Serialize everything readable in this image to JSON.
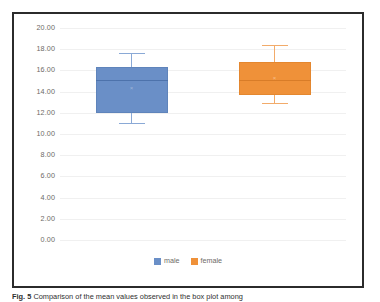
{
  "figure": {
    "caption_label": "Fig. 5",
    "caption_text": "Comparison of the mean values observed in the box plot among"
  },
  "chart_data": {
    "type": "box",
    "title": "",
    "xlabel": "",
    "ylabel": "",
    "ylim": [
      0.0,
      20.0
    ],
    "ytick_step": 2.0,
    "ytick_labels": [
      "20.00",
      "18.00",
      "16.00",
      "14.00",
      "12.00",
      "10.00",
      "8.00",
      "6.00",
      "4.00",
      "2.00",
      "0.00"
    ],
    "ytick_values": [
      20.0,
      18.0,
      16.0,
      14.0,
      12.0,
      10.0,
      8.0,
      6.0,
      4.0,
      2.0,
      0.0
    ],
    "grid": true,
    "legend_position": "bottom",
    "categories": [
      "male",
      "female"
    ],
    "series": [
      {
        "name": "male",
        "color": "#6a8fc7",
        "whisker_low": 11.0,
        "q1": 12.0,
        "median": 15.1,
        "mean": 14.3,
        "q3": 16.3,
        "whisker_high": 17.6
      },
      {
        "name": "female",
        "color": "#ef9139",
        "whisker_low": 12.9,
        "q1": 13.7,
        "median": 15.1,
        "mean": 15.2,
        "q3": 16.8,
        "whisker_high": 18.4
      }
    ],
    "legend": [
      {
        "label": "male",
        "color": "#6a8fc7"
      },
      {
        "label": "female",
        "color": "#ef9139"
      }
    ]
  }
}
